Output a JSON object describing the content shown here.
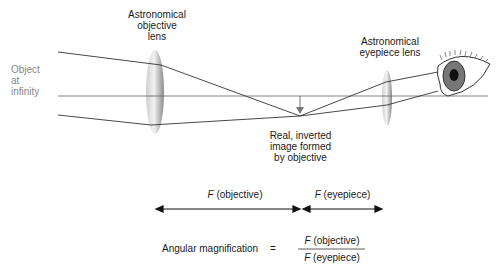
{
  "labels": {
    "objective_lens": [
      "Astronomical",
      "objective",
      "lens"
    ],
    "eyepiece_lens": [
      "Astronomical",
      "eyepiece lens"
    ],
    "object": [
      "Object",
      "at",
      "infinity"
    ],
    "image": [
      "Real, inverted",
      "image formed",
      "by objective"
    ]
  },
  "focal": {
    "objective_F": "F",
    "objective_text": "(objective)",
    "eyepiece_F": "F",
    "eyepiece_text": "(eyepiece)"
  },
  "formula": {
    "lhs": "Angular magnification",
    "equals": "=",
    "num_F": "F",
    "num_text": "(objective)",
    "den_F": "F",
    "den_text": "(eyepiece)"
  },
  "colors": {
    "ray": "#333333",
    "lens": "#999999",
    "iris": "#777777",
    "label_gray": "#888888"
  }
}
